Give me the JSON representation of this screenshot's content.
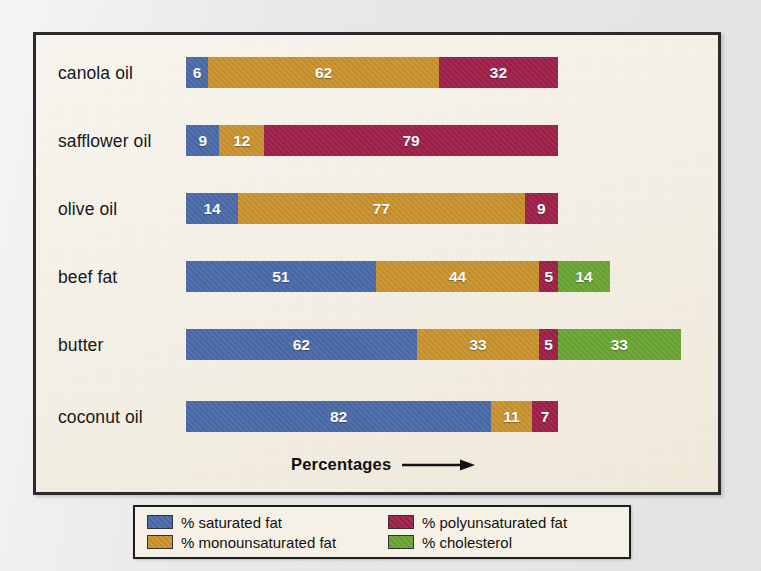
{
  "chart_data": {
    "type": "bar",
    "subtype": "stacked-horizontal",
    "title": "",
    "xlabel": "Percentages",
    "ylabel": "",
    "categories": [
      "canola oil",
      "safflower oil",
      "olive oil",
      "beef fat",
      "butter",
      "coconut oil"
    ],
    "series": [
      {
        "name": "% saturated fat",
        "color": "#4a6aa8",
        "values": [
          6,
          9,
          14,
          51,
          62,
          82
        ]
      },
      {
        "name": "% monounsaturated fat",
        "color": "#c9922e",
        "values": [
          62,
          12,
          77,
          44,
          33,
          11
        ]
      },
      {
        "name": "% polyunsaturated fat",
        "color": "#9e2049",
        "values": [
          32,
          79,
          9,
          5,
          5,
          7
        ]
      },
      {
        "name": "% cholesterol",
        "color": "#6ba534",
        "values": [
          0,
          0,
          0,
          14,
          33,
          0
        ]
      }
    ],
    "rows": [
      {
        "label": "canola oil",
        "segments": [
          {
            "key": "sat",
            "value": 6
          },
          {
            "key": "mono",
            "value": 62
          },
          {
            "key": "poly",
            "value": 32
          }
        ]
      },
      {
        "label": "safflower oil",
        "segments": [
          {
            "key": "sat",
            "value": 9
          },
          {
            "key": "mono",
            "value": 12
          },
          {
            "key": "poly",
            "value": 79
          }
        ]
      },
      {
        "label": "olive oil",
        "segments": [
          {
            "key": "sat",
            "value": 14
          },
          {
            "key": "mono",
            "value": 77
          },
          {
            "key": "poly",
            "value": 9
          }
        ]
      },
      {
        "label": "beef fat",
        "segments": [
          {
            "key": "sat",
            "value": 51
          },
          {
            "key": "mono",
            "value": 44
          },
          {
            "key": "poly",
            "value": 5
          },
          {
            "key": "chol",
            "value": 14
          }
        ]
      },
      {
        "label": "butter",
        "segments": [
          {
            "key": "sat",
            "value": 62
          },
          {
            "key": "mono",
            "value": 33
          },
          {
            "key": "poly",
            "value": 5
          },
          {
            "key": "chol",
            "value": 33
          }
        ]
      },
      {
        "label": "coconut oil",
        "segments": [
          {
            "key": "sat",
            "value": 82
          },
          {
            "key": "mono",
            "value": 11
          },
          {
            "key": "poly",
            "value": 7
          }
        ]
      }
    ],
    "xlim": [
      0,
      133
    ],
    "grid": false,
    "legend_position": "bottom"
  },
  "axis": {
    "caption": "Percentages",
    "arrow_icon": "right-arrow-icon"
  },
  "legend": {
    "entries": [
      {
        "key": "sat",
        "label": "% saturated fat",
        "color": "#4a6aa8"
      },
      {
        "key": "mono",
        "label": "% monounsaturated fat",
        "color": "#c9922e"
      },
      {
        "key": "poly",
        "label": "% polyunsaturated fat",
        "color": "#9e2049"
      },
      {
        "key": "chol",
        "label": "% cholesterol",
        "color": "#6ba534"
      }
    ]
  },
  "colors": {
    "saturated": "#4a6aa8",
    "monounsaturated": "#c9922e",
    "polyunsaturated": "#9e2049",
    "cholesterol": "#6ba534",
    "panel_background": "#f3eee1",
    "page_background": "#e9e9e9",
    "frame_border": "#2b2b2b"
  }
}
